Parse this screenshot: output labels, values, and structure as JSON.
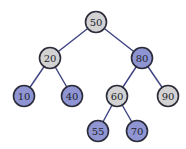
{
  "diagram": {
    "type": "binary-search-tree",
    "colors": {
      "gray_fill": "#d2d2d2",
      "blue_fill": "#8e95d2",
      "outline": "#2b2b3a",
      "edge": "#3d4280"
    },
    "nodes": [
      {
        "id": "n50",
        "label": "50",
        "x": 96,
        "y": 22,
        "color": "gray"
      },
      {
        "id": "n20",
        "label": "20",
        "x": 50,
        "y": 58,
        "color": "gray"
      },
      {
        "id": "n80",
        "label": "80",
        "x": 142,
        "y": 58,
        "color": "blue"
      },
      {
        "id": "n10",
        "label": "10",
        "x": 24,
        "y": 96,
        "color": "blue"
      },
      {
        "id": "n40",
        "label": "40",
        "x": 72,
        "y": 96,
        "color": "blue"
      },
      {
        "id": "n60",
        "label": "60",
        "x": 117,
        "y": 96,
        "color": "gray"
      },
      {
        "id": "n90",
        "label": "90",
        "x": 168,
        "y": 96,
        "color": "gray"
      },
      {
        "id": "n55",
        "label": "55",
        "x": 98,
        "y": 131,
        "color": "blue"
      },
      {
        "id": "n70",
        "label": "70",
        "x": 137,
        "y": 131,
        "color": "blue"
      }
    ],
    "edges": [
      {
        "from": "50",
        "to": "20"
      },
      {
        "from": "50",
        "to": "80"
      },
      {
        "from": "20",
        "to": "10"
      },
      {
        "from": "20",
        "to": "40"
      },
      {
        "from": "80",
        "to": "60"
      },
      {
        "from": "80",
        "to": "90"
      },
      {
        "from": "60",
        "to": "55"
      },
      {
        "from": "60",
        "to": "70"
      }
    ]
  }
}
